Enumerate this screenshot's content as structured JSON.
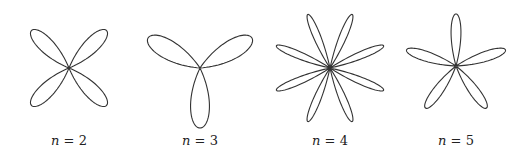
{
  "figure": {
    "stroke_color": "#333333",
    "background": "#ffffff"
  },
  "chart_data": {
    "type": "diagram",
    "title": "",
    "panels": [
      {
        "n": 2,
        "label_var": "n",
        "label_eq": " = ",
        "label_val": "2",
        "petals": 4,
        "cx": 69,
        "cy": 68,
        "radius": 53,
        "rotation_deg": 45,
        "width_factor": 1.0
      },
      {
        "n": 3,
        "label_var": "n",
        "label_eq": " = ",
        "label_val": "3",
        "petals": 3,
        "cx": 200,
        "cy": 68,
        "radius": 60,
        "rotation_deg": 90,
        "width_factor": 0.85
      },
      {
        "n": 4,
        "label_var": "n",
        "label_eq": " = ",
        "label_val": "4",
        "petals": 8,
        "cx": 330,
        "cy": 68,
        "radius": 58,
        "rotation_deg": 22.5,
        "width_factor": 0.9
      },
      {
        "n": 5,
        "label_var": "n",
        "label_eq": " = ",
        "label_val": "5",
        "petals": 5,
        "cx": 456,
        "cy": 66,
        "radius": 52,
        "rotation_deg": -90,
        "width_factor": 0.85
      }
    ]
  },
  "labels": [
    {
      "var": "n",
      "eq": " = ",
      "val": "2",
      "x": 29
    },
    {
      "var": "n",
      "eq": " = ",
      "val": "3",
      "x": 160
    },
    {
      "var": "n",
      "eq": " = ",
      "val": "4",
      "x": 290
    },
    {
      "var": "n",
      "eq": " = ",
      "val": "5",
      "x": 416
    }
  ]
}
